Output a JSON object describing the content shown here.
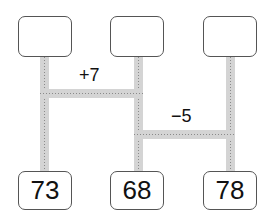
{
  "diagram": {
    "type": "amidakuji-ladder",
    "top_boxes": [
      {
        "label": ""
      },
      {
        "label": ""
      },
      {
        "label": ""
      }
    ],
    "bottom_boxes": [
      {
        "label": "73"
      },
      {
        "label": "68"
      },
      {
        "label": "78"
      }
    ],
    "rungs": [
      {
        "from_column": 1,
        "to_column": 2,
        "operation": "+7"
      },
      {
        "from_column": 2,
        "to_column": 3,
        "operation": "−5"
      }
    ],
    "colors": {
      "bar": "#d4d4d4",
      "bar_dots": "#8a8a8a",
      "box_border": "#555555",
      "text": "#111111"
    }
  }
}
